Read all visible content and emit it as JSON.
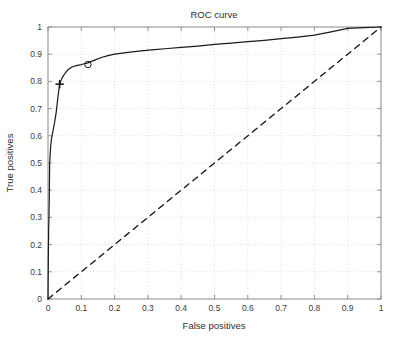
{
  "figure": {
    "background_color": "#ffffff",
    "frame_color": "#8a8a8a",
    "grid_color": "#c8c8c8"
  },
  "chart_data": {
    "type": "line",
    "title": "ROC curve",
    "xlabel": "False positives",
    "ylabel": "True positives",
    "xlim": [
      0,
      1
    ],
    "ylim": [
      0,
      1
    ],
    "grid": true,
    "legend": null,
    "xticks": [
      "0",
      "0.1",
      "0.2",
      "0.3",
      "0.4",
      "0.5",
      "0.6",
      "0.7",
      "0.8",
      "0.9",
      "1"
    ],
    "yticks": [
      "0",
      "0.1",
      "0.2",
      "0.3",
      "0.4",
      "0.5",
      "0.6",
      "0.7",
      "0.8",
      "0.9",
      "1"
    ],
    "xtick_values": [
      0,
      0.1,
      0.2,
      0.3,
      0.4,
      0.5,
      0.6,
      0.7,
      0.8,
      0.9,
      1
    ],
    "ytick_values": [
      0,
      0.1,
      0.2,
      0.3,
      0.4,
      0.5,
      0.6,
      0.7,
      0.8,
      0.9,
      1
    ],
    "series": [
      {
        "name": "ROC curve",
        "style": "solid",
        "color": "#1a1a1a",
        "x": [
          0.0,
          0.001,
          0.002,
          0.003,
          0.004,
          0.005,
          0.006,
          0.008,
          0.01,
          0.013,
          0.016,
          0.02,
          0.025,
          0.03,
          0.035,
          0.042,
          0.05,
          0.06,
          0.072,
          0.085,
          0.1,
          0.12,
          0.14,
          0.16,
          0.18,
          0.2,
          0.24,
          0.28,
          0.32,
          0.36,
          0.4,
          0.45,
          0.5,
          0.55,
          0.6,
          0.65,
          0.7,
          0.75,
          0.8,
          0.85,
          0.9,
          0.95,
          1.0
        ],
        "y": [
          0.0,
          0.15,
          0.26,
          0.31,
          0.39,
          0.5,
          0.52,
          0.56,
          0.585,
          0.605,
          0.625,
          0.65,
          0.69,
          0.745,
          0.79,
          0.812,
          0.828,
          0.843,
          0.853,
          0.858,
          0.862,
          0.868,
          0.878,
          0.888,
          0.895,
          0.9,
          0.907,
          0.912,
          0.917,
          0.921,
          0.925,
          0.93,
          0.936,
          0.941,
          0.946,
          0.951,
          0.957,
          0.963,
          0.97,
          0.982,
          0.995,
          0.998,
          1.0
        ]
      },
      {
        "name": "chance diagonal",
        "style": "dashed",
        "color": "#111111",
        "x": [
          0,
          1
        ],
        "y": [
          0,
          1
        ]
      }
    ],
    "annotations": [
      {
        "marker": "plus",
        "label": "operating-point-plus",
        "x": 0.035,
        "y": 0.79
      },
      {
        "marker": "circle",
        "label": "operating-point-circle",
        "x": 0.12,
        "y": 0.862
      }
    ]
  }
}
